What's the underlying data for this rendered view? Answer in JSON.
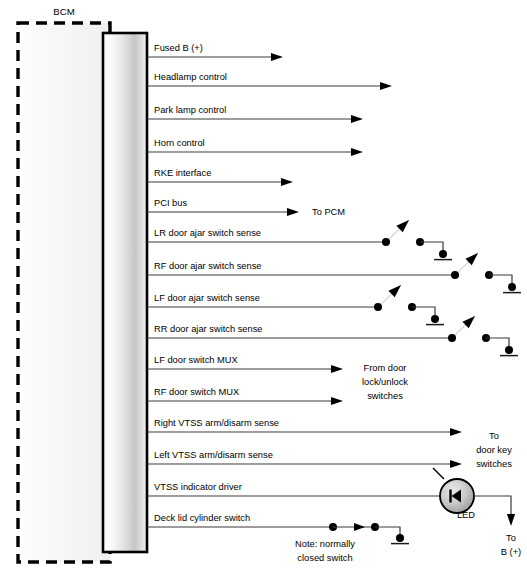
{
  "diagram": {
    "module_label": "BCM",
    "note": {
      "line1": "Note: normally",
      "line2": "closed switch"
    },
    "annotations": {
      "to_pcm": "To PCM",
      "from_door_lock_1": "From door",
      "from_door_lock_2": "lock/unlock",
      "from_door_lock_3": "switches",
      "to_door_key_1": "To",
      "to_door_key_2": "door key",
      "to_door_key_3": "switches",
      "led": "LED",
      "to_b_plus_1": "To",
      "to_b_plus_2": "B (+)"
    },
    "wires": [
      {
        "label": "Fused B (+)",
        "y": 57,
        "end": 283,
        "type": "arrow"
      },
      {
        "label": "Headlamp control",
        "y": 86,
        "end": 392,
        "type": "arrow"
      },
      {
        "label": "Park lamp control",
        "y": 119,
        "end": 363,
        "type": "arrow"
      },
      {
        "label": "Horn control",
        "y": 152,
        "end": 363,
        "type": "arrow"
      },
      {
        "label": "RKE interface",
        "y": 182,
        "end": 293,
        "type": "arrow"
      },
      {
        "label": "PCI bus",
        "y": 212,
        "end": 299,
        "type": "arrow"
      },
      {
        "label": "LR door ajar switch sense",
        "y": 242,
        "end": 386,
        "type": "switch"
      },
      {
        "label": "RF door ajar switch sense",
        "y": 275,
        "end": 455,
        "type": "switch"
      },
      {
        "label": "LF door ajar switch sense",
        "y": 307,
        "end": 378,
        "type": "switch"
      },
      {
        "label": "RR door ajar switch sense",
        "y": 338,
        "end": 452,
        "type": "switch"
      },
      {
        "label": "LF door switch MUX",
        "y": 369,
        "end": 343,
        "type": "arrow"
      },
      {
        "label": "RF door switch MUX",
        "y": 401,
        "end": 343,
        "type": "arrow"
      },
      {
        "label": "Right VTSS arm/disarm sense",
        "y": 432,
        "end": 462,
        "type": "arrow"
      },
      {
        "label": "Left VTSS arm/disarm sense",
        "y": 464,
        "end": 462,
        "type": "arrow"
      },
      {
        "label": "VTSS indicator driver",
        "y": 496,
        "end": 440,
        "type": "led"
      },
      {
        "label": "Deck lid cylinder switch",
        "y": 527,
        "end": 333,
        "type": "nc-switch"
      }
    ],
    "colors": {
      "wire": "#3a3a3a",
      "switch_arm": "#d8d8d8",
      "outline": "#000000",
      "background": "#ffffff"
    }
  }
}
